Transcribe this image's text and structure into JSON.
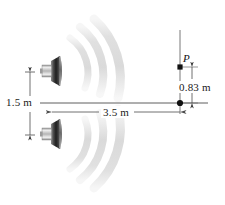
{
  "figure": {
    "type": "physics-diagram",
    "background_color": "#ffffff",
    "line_color": "#4d4d4d",
    "point_color": "#111111",
    "wave_color": "#e3e3e3",
    "speaker_dark": "#2b2b2b",
    "speaker_light": "#d8d8d8"
  },
  "labels": {
    "separation": "1.5 m",
    "distance": "3.5 m",
    "offset": "0.83 m",
    "point": "P"
  },
  "geometry": {
    "speaker_top": {
      "x": 52,
      "y": 72
    },
    "speaker_bottom": {
      "x": 52,
      "y": 135
    },
    "axis_y": 103,
    "screen_x": 180,
    "point_p": {
      "x": 180,
      "y": 67
    },
    "center_point": {
      "x": 180,
      "y": 103
    }
  },
  "elements": {
    "wave_arcs_top": 3,
    "wave_arcs_bottom": 3,
    "speakers": 2,
    "dimension_lines": 3
  }
}
